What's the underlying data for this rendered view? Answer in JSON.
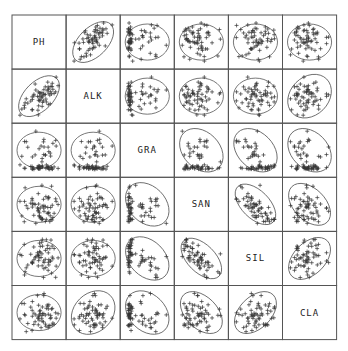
{
  "chart_data": {
    "type": "scatter",
    "title": "",
    "subtitle": "Scatterplot matrix with concentration ellipses",
    "variables": [
      "PH",
      "ALK",
      "GRA",
      "SAN",
      "SIL",
      "CLA"
    ],
    "marker": "+",
    "grid": false,
    "legend": null,
    "layout": {
      "origin_x": 12,
      "origin_y": 15,
      "cell_size": 54.1,
      "n": 6
    },
    "correlations": [
      [
        1.0,
        0.7,
        0.1,
        0.05,
        -0.05,
        0.15
      ],
      [
        0.7,
        1.0,
        0.15,
        0.05,
        0.1,
        0.2
      ],
      [
        0.1,
        0.15,
        1.0,
        -0.3,
        -0.35,
        -0.3
      ],
      [
        0.05,
        0.05,
        -0.3,
        1.0,
        -0.75,
        -0.55
      ],
      [
        -0.05,
        0.1,
        -0.35,
        -0.75,
        1.0,
        0.55
      ],
      [
        0.15,
        0.2,
        -0.3,
        -0.55,
        0.55,
        1.0
      ]
    ],
    "skew": {
      "GRA": "right-skewed, many values near zero",
      "SAN": "bimodal-ish spread",
      "PH": "left tail outliers"
    },
    "n_points": 60
  }
}
